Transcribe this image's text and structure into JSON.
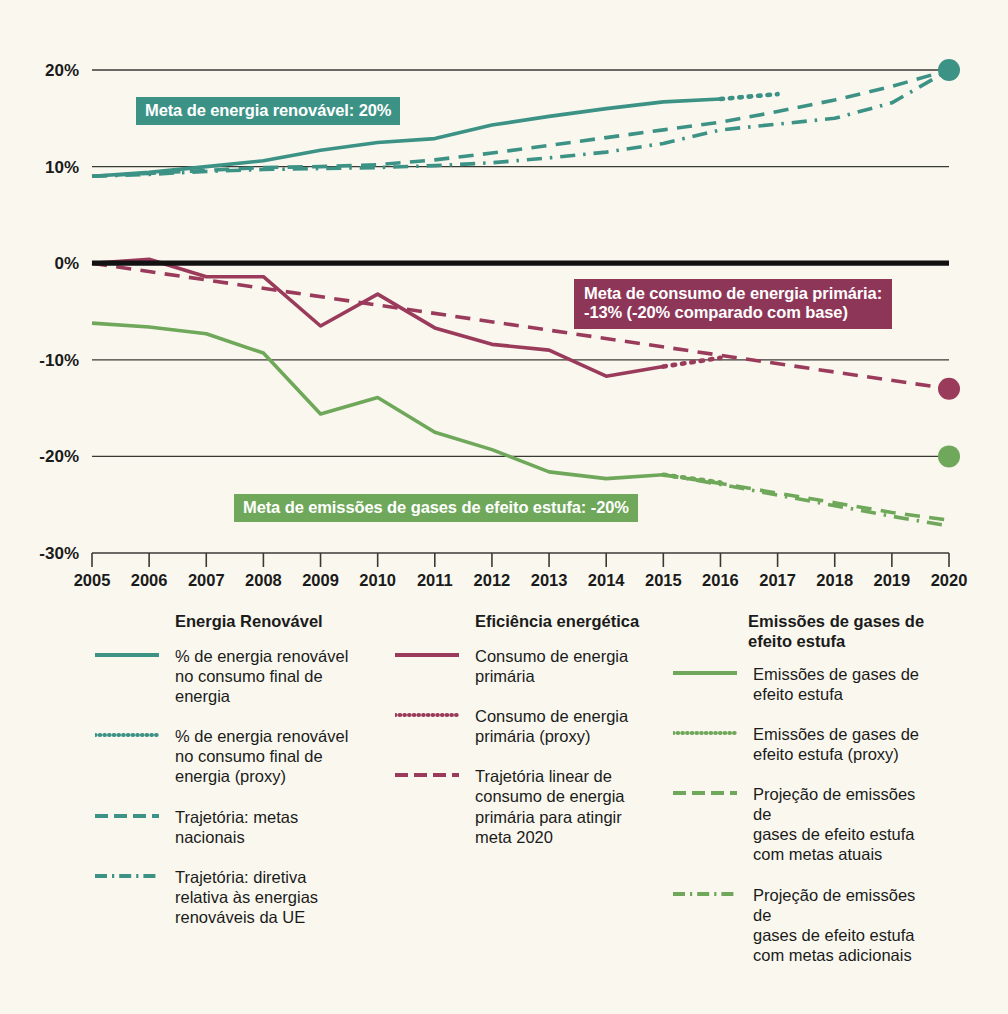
{
  "colors": {
    "background": "#faf8ee",
    "teal": "#3d9286",
    "maroon": "#9b3b5c",
    "green": "#6fa85a",
    "axis": "#3a3a34",
    "zero_line": "#121212",
    "text": "#1b1b1b"
  },
  "banners": {
    "renewable": "Meta de energia renovável: 20%",
    "primary_energy": "Meta de consumo de energia primária:\n-13% (-20% comparado com base)",
    "emissions": "Meta de emissões de gases de efeito estufa: -20%"
  },
  "legend": {
    "columns": [
      {
        "title": "Energia Renovável",
        "items": [
          {
            "style": "solid",
            "color": "#3d9286",
            "label": "% de energia renovável\nno consumo final de\nenergia"
          },
          {
            "style": "dotted",
            "color": "#3d9286",
            "label": "% de energia renovável\nno consumo final de\nenergia (proxy)"
          },
          {
            "style": "dashed",
            "color": "#3d9286",
            "label": "Trajetória: metas\nnacionais"
          },
          {
            "style": "dashdot",
            "color": "#3d9286",
            "label": "Trajetória: diretiva\nrelativa às energias\nrenováveis da UE"
          }
        ]
      },
      {
        "title": "Eficiência energética",
        "items": [
          {
            "style": "solid",
            "color": "#9b3b5c",
            "label": "Consumo de energia\nprimária"
          },
          {
            "style": "dotted",
            "color": "#9b3b5c",
            "label": "Consumo de energia\nprimária (proxy)"
          },
          {
            "style": "dashed",
            "color": "#9b3b5c",
            "label": "Trajetória linear de\nconsumo de energia\nprimária para atingir\nmeta 2020"
          }
        ]
      },
      {
        "title": "Emissões de gases de\nefeito estufa",
        "items": [
          {
            "style": "solid",
            "color": "#6fa85a",
            "label": "Emissões de gases de\nefeito estufa"
          },
          {
            "style": "dotted",
            "color": "#6fa85a",
            "label": "Emissões de gases de\nefeito estufa (proxy)"
          },
          {
            "style": "dashed",
            "color": "#6fa85a",
            "label": "Projeção de emissões de\ngases de efeito estufa\ncom metas atuais"
          },
          {
            "style": "dashdot",
            "color": "#6fa85a",
            "label": "Projeção de emissões de\ngases de efeito estufa\ncom metas adicionais"
          }
        ]
      }
    ]
  },
  "chart_data": {
    "type": "line",
    "title": "",
    "xlabel": "",
    "ylabel": "",
    "grid": true,
    "legend_position": "below",
    "x": [
      2005,
      2006,
      2007,
      2008,
      2009,
      2010,
      2011,
      2012,
      2013,
      2014,
      2015,
      2016,
      2017,
      2018,
      2019,
      2020
    ],
    "xlim": [
      2005,
      2020
    ],
    "ylim": [
      -30,
      20
    ],
    "yticks": [
      20,
      10,
      0,
      -10,
      -20,
      -30
    ],
    "ytick_labels": [
      "20%",
      "10%",
      "0%",
      "-10%",
      "-20%",
      "-30%"
    ],
    "xtick_labels": [
      "2005",
      "2006",
      "2007",
      "2008",
      "2009",
      "2010",
      "2011",
      "2012",
      "2013",
      "2014",
      "2015",
      "2016",
      "2017",
      "2018",
      "2019",
      "2020"
    ],
    "series": [
      {
        "name": "% de energia renovável no consumo final de energia",
        "color": "#3d9286",
        "style": "solid",
        "x": [
          2005,
          2006,
          2007,
          2008,
          2009,
          2010,
          2011,
          2012,
          2013,
          2014,
          2015,
          2016
        ],
        "values": [
          9.0,
          9.4,
          10.0,
          10.6,
          11.7,
          12.5,
          12.9,
          14.3,
          15.2,
          16.0,
          16.7,
          17.0
        ]
      },
      {
        "name": "% de energia renovável no consumo final de energia (proxy)",
        "color": "#3d9286",
        "style": "dotted",
        "x": [
          2016,
          2017
        ],
        "values": [
          17.0,
          17.5
        ]
      },
      {
        "name": "Trajetória: metas nacionais",
        "color": "#3d9286",
        "style": "dashed",
        "x": [
          2005,
          2006,
          2007,
          2008,
          2009,
          2010,
          2011,
          2012,
          2013,
          2014,
          2015,
          2016,
          2017,
          2018,
          2019,
          2020
        ],
        "values": [
          9.0,
          9.3,
          9.6,
          9.9,
          10.0,
          10.2,
          10.7,
          11.4,
          12.2,
          13.0,
          13.8,
          14.6,
          15.7,
          16.9,
          18.3,
          20.0
        ]
      },
      {
        "name": "Trajetória: diretiva relativa às energias renováveis da UE",
        "color": "#3d9286",
        "style": "dashdot",
        "x": [
          2005,
          2006,
          2007,
          2008,
          2009,
          2010,
          2011,
          2012,
          2013,
          2014,
          2015,
          2016,
          2017,
          2018,
          2019,
          2020
        ],
        "values": [
          9.0,
          9.2,
          9.5,
          9.7,
          9.8,
          9.9,
          10.1,
          10.4,
          10.9,
          11.5,
          12.4,
          13.8,
          14.4,
          15.0,
          16.6,
          20.0
        ]
      },
      {
        "name": "Consumo de energia primária",
        "color": "#9b3b5c",
        "style": "solid",
        "x": [
          2005,
          2006,
          2007,
          2008,
          2009,
          2010,
          2011,
          2012,
          2013,
          2014,
          2015
        ],
        "values": [
          0.0,
          0.4,
          -1.4,
          -1.4,
          -6.5,
          -3.2,
          -6.7,
          -8.4,
          -9.0,
          -11.7,
          -10.7
        ]
      },
      {
        "name": "Consumo de energia primária (proxy)",
        "color": "#9b3b5c",
        "style": "dotted",
        "x": [
          2015,
          2016
        ],
        "values": [
          -10.7,
          -9.8
        ]
      },
      {
        "name": "Trajetória linear de consumo de energia primária para atingir meta 2020",
        "color": "#9b3b5c",
        "style": "dashed",
        "x": [
          2005,
          2020
        ],
        "values": [
          0.0,
          -13.0
        ]
      },
      {
        "name": "Emissões de gases de efeito estufa",
        "color": "#6fa85a",
        "style": "solid",
        "x": [
          2005,
          2006,
          2007,
          2008,
          2009,
          2010,
          2011,
          2012,
          2013,
          2014,
          2015
        ],
        "values": [
          -6.2,
          -6.6,
          -7.3,
          -9.3,
          -15.6,
          -13.9,
          -17.5,
          -19.3,
          -21.6,
          -22.3,
          -21.9
        ]
      },
      {
        "name": "Emissões de gases de efeito estufa (proxy)",
        "color": "#6fa85a",
        "style": "dotted",
        "x": [
          2015,
          2016
        ],
        "values": [
          -21.9,
          -22.7
        ]
      },
      {
        "name": "Projeção de emissões de gases de efeito estufa com metas atuais",
        "color": "#6fa85a",
        "style": "dashed",
        "x": [
          2015,
          2016,
          2017,
          2018,
          2019,
          2020
        ],
        "values": [
          -21.9,
          -22.8,
          -23.8,
          -24.8,
          -25.8,
          -26.6
        ]
      },
      {
        "name": "Projeção de emissões de gases de efeito estufa com metas adicionais",
        "color": "#6fa85a",
        "style": "dashdot",
        "x": [
          2015,
          2016,
          2017,
          2018,
          2019,
          2020
        ],
        "values": [
          -21.9,
          -22.9,
          -24.0,
          -25.1,
          -26.2,
          -27.2
        ]
      }
    ],
    "endpoint_markers": [
      {
        "name": "meta-renewable-2020",
        "x": 2020,
        "y": 20.0,
        "color": "#3d9286"
      },
      {
        "name": "meta-primary-energy-2020",
        "x": 2020,
        "y": -13.0,
        "color": "#9b3b5c"
      },
      {
        "name": "meta-emissions-2020",
        "x": 2020,
        "y": -20.0,
        "color": "#6fa85a"
      }
    ],
    "reference_lines": [
      {
        "name": "zero-baseline",
        "y": 0,
        "color": "#121212"
      }
    ]
  }
}
